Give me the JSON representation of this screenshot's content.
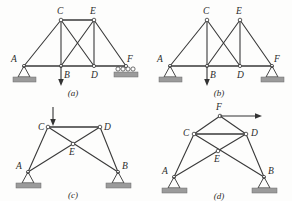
{
  "figure": {
    "background_color": "#fdfdfc",
    "line_color": "#3a3a3a",
    "ground_color": "#9b9b9b",
    "panels": [
      {
        "id": "panel-a",
        "caption": "(a)",
        "nodes": [
          {
            "name": "A",
            "label": "A"
          },
          {
            "name": "B",
            "label": "B"
          },
          {
            "name": "C",
            "label": "C"
          },
          {
            "name": "D",
            "label": "D"
          },
          {
            "name": "E",
            "label": "E"
          },
          {
            "name": "F",
            "label": "F"
          }
        ],
        "supports": [
          {
            "at": "A",
            "type": "pin"
          },
          {
            "at": "F",
            "type": "roller"
          }
        ],
        "loads": [
          {
            "at": "B",
            "direction": "down"
          }
        ]
      },
      {
        "id": "panel-b",
        "caption": "(b)",
        "nodes": [
          {
            "name": "A",
            "label": "A"
          },
          {
            "name": "B",
            "label": "B"
          },
          {
            "name": "C",
            "label": "C"
          },
          {
            "name": "D",
            "label": "D"
          },
          {
            "name": "E",
            "label": "E"
          },
          {
            "name": "F",
            "label": "F"
          }
        ],
        "supports": [
          {
            "at": "A",
            "type": "pin"
          },
          {
            "at": "F",
            "type": "pin"
          }
        ],
        "loads": [
          {
            "at": "B",
            "direction": "down"
          }
        ]
      },
      {
        "id": "panel-c",
        "caption": "(c)",
        "nodes": [
          {
            "name": "A",
            "label": "A"
          },
          {
            "name": "B",
            "label": "B"
          },
          {
            "name": "C",
            "label": "C"
          },
          {
            "name": "D",
            "label": "D"
          },
          {
            "name": "E",
            "label": "E"
          }
        ],
        "supports": [
          {
            "at": "A",
            "type": "pin"
          },
          {
            "at": "B",
            "type": "pin"
          }
        ],
        "loads": [
          {
            "at": "C",
            "direction": "down"
          }
        ]
      },
      {
        "id": "panel-d",
        "caption": "(d)",
        "nodes": [
          {
            "name": "A",
            "label": "A"
          },
          {
            "name": "B",
            "label": "B"
          },
          {
            "name": "C",
            "label": "C"
          },
          {
            "name": "D",
            "label": "D"
          },
          {
            "name": "E",
            "label": "E"
          },
          {
            "name": "F",
            "label": "F"
          }
        ],
        "supports": [
          {
            "at": "A",
            "type": "pin"
          },
          {
            "at": "B",
            "type": "pin"
          }
        ],
        "loads": [
          {
            "at": "F",
            "direction": "right"
          }
        ]
      }
    ]
  }
}
